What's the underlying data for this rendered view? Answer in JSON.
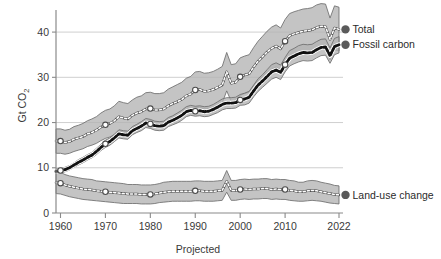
{
  "chart_data": {
    "type": "line",
    "title": "",
    "subtitle": "",
    "xlabel": "Projected",
    "ylabel": "Gt CO2",
    "ylabel_display": "Gt CO",
    "ylabel_sub": "2",
    "xlim": [
      1959,
      2022
    ],
    "ylim": [
      0,
      44
    ],
    "grid": "horizontal",
    "x_ticks": [
      1960,
      1970,
      1980,
      1990,
      2000,
      2010,
      2022
    ],
    "x_tick_labels": [
      "1960",
      "1970",
      "1980",
      "1990",
      "2000",
      "2010",
      "2022"
    ],
    "y_ticks": [
      0,
      10,
      20,
      30,
      40
    ],
    "y_tick_labels": [
      "0",
      "10",
      "20",
      "30",
      "40"
    ],
    "legend_position": "right",
    "marker_years": [
      1960,
      1970,
      1980,
      1990,
      2000,
      2010
    ],
    "end_point_year": 2022,
    "series": [
      {
        "name": "Total",
        "style": "white-dotted",
        "band": "uncertainty",
        "end_value": 40.6,
        "x": [
          1959,
          1960,
          1961,
          1962,
          1963,
          1964,
          1965,
          1966,
          1967,
          1968,
          1969,
          1970,
          1971,
          1972,
          1973,
          1974,
          1975,
          1976,
          1977,
          1978,
          1979,
          1980,
          1981,
          1982,
          1983,
          1984,
          1985,
          1986,
          1987,
          1988,
          1989,
          1990,
          1991,
          1992,
          1993,
          1994,
          1995,
          1996,
          1997,
          1998,
          1999,
          2000,
          2001,
          2002,
          2003,
          2004,
          2005,
          2006,
          2007,
          2008,
          2009,
          2010,
          2011,
          2012,
          2013,
          2014,
          2015,
          2016,
          2017,
          2018,
          2019,
          2020,
          2021,
          2022
        ],
        "values": [
          15.9,
          15.9,
          15.6,
          15.8,
          16.3,
          16.6,
          16.9,
          17.5,
          17.8,
          18.3,
          19.0,
          19.5,
          19.8,
          20.4,
          21.3,
          21.0,
          20.8,
          21.6,
          22.1,
          22.4,
          23.0,
          23.1,
          22.8,
          22.8,
          23.0,
          23.7,
          24.2,
          24.6,
          25.1,
          25.9,
          26.3,
          27.2,
          27.3,
          26.9,
          27.0,
          27.3,
          27.8,
          28.3,
          31.2,
          28.7,
          28.9,
          30.1,
          30.5,
          30.8,
          32.3,
          33.6,
          34.6,
          35.6,
          36.4,
          36.9,
          36.3,
          38.0,
          39.2,
          39.6,
          39.9,
          40.2,
          40.3,
          40.5,
          41.0,
          41.3,
          41.2,
          38.4,
          40.9,
          40.6
        ],
        "band_lower": [
          13.2,
          13.2,
          13.0,
          13.2,
          13.6,
          13.9,
          14.2,
          14.7,
          15.0,
          15.4,
          16.0,
          16.5,
          16.8,
          17.3,
          18.1,
          17.9,
          17.7,
          18.4,
          18.8,
          19.1,
          19.6,
          19.7,
          19.4,
          19.4,
          19.6,
          20.2,
          20.6,
          21.0,
          21.4,
          22.1,
          22.5,
          23.3,
          23.4,
          23.0,
          23.1,
          23.4,
          23.8,
          24.3,
          27.0,
          24.7,
          24.9,
          26.0,
          26.4,
          26.7,
          28.1,
          29.3,
          30.2,
          31.1,
          31.8,
          32.3,
          31.7,
          33.3,
          34.4,
          34.8,
          35.1,
          35.4,
          35.5,
          35.7,
          36.2,
          36.5,
          36.4,
          33.8,
          36.1,
          35.8
        ],
        "band_upper": [
          18.6,
          18.6,
          18.3,
          18.5,
          19.1,
          19.4,
          19.8,
          20.4,
          20.8,
          21.3,
          22.1,
          22.7,
          23.0,
          23.7,
          24.7,
          24.4,
          24.2,
          25.0,
          25.6,
          25.9,
          26.6,
          26.7,
          26.4,
          26.4,
          26.6,
          27.4,
          27.9,
          28.4,
          28.9,
          29.8,
          30.2,
          31.2,
          31.3,
          30.9,
          31.0,
          31.3,
          31.8,
          32.4,
          35.5,
          32.8,
          33.0,
          34.3,
          34.7,
          35.0,
          36.6,
          38.0,
          39.1,
          40.2,
          41.1,
          41.6,
          40.9,
          42.8,
          44.1,
          44.5,
          44.8,
          45.1,
          45.2,
          45.4,
          46.0,
          46.3,
          46.2,
          43.1,
          45.8,
          45.5
        ]
      },
      {
        "name": "Fossil carbon",
        "style": "black-dotted",
        "band": "uncertainty",
        "end_value": 37.2,
        "x": [
          1959,
          1960,
          1961,
          1962,
          1963,
          1964,
          1965,
          1966,
          1967,
          1968,
          1969,
          1970,
          1971,
          1972,
          1973,
          1974,
          1975,
          1976,
          1977,
          1978,
          1979,
          1980,
          1981,
          1982,
          1983,
          1984,
          1985,
          1986,
          1987,
          1988,
          1989,
          1990,
          1991,
          1992,
          1993,
          1994,
          1995,
          1996,
          1997,
          1998,
          1999,
          2000,
          2001,
          2002,
          2003,
          2004,
          2005,
          2006,
          2007,
          2008,
          2009,
          2010,
          2011,
          2012,
          2013,
          2014,
          2015,
          2016,
          2017,
          2018,
          2019,
          2020,
          2021,
          2022
        ],
        "values": [
          9.2,
          9.4,
          9.6,
          10.0,
          10.6,
          11.2,
          11.7,
          12.3,
          12.8,
          13.6,
          14.5,
          15.3,
          15.8,
          16.6,
          17.5,
          17.3,
          17.2,
          18.2,
          18.7,
          19.2,
          19.9,
          19.7,
          19.3,
          19.2,
          19.3,
          20.1,
          20.5,
          21.0,
          21.6,
          22.4,
          22.7,
          22.5,
          22.6,
          22.4,
          22.5,
          22.9,
          23.4,
          24.0,
          24.3,
          24.3,
          24.4,
          25.0,
          25.2,
          25.6,
          27.0,
          28.3,
          29.2,
          30.2,
          31.2,
          31.6,
          31.1,
          32.8,
          34.2,
          34.7,
          35.2,
          35.5,
          35.4,
          35.5,
          36.1,
          36.6,
          36.7,
          34.8,
          36.8,
          37.2
        ],
        "band_lower": [
          8.7,
          8.9,
          9.1,
          9.5,
          10.1,
          10.6,
          11.1,
          11.7,
          12.2,
          12.9,
          13.8,
          14.5,
          15.0,
          15.8,
          16.6,
          16.4,
          16.3,
          17.3,
          17.8,
          18.2,
          18.9,
          18.7,
          18.3,
          18.2,
          18.3,
          19.1,
          19.5,
          19.9,
          20.5,
          21.3,
          21.6,
          21.4,
          21.5,
          21.3,
          21.4,
          21.8,
          22.2,
          22.8,
          23.1,
          23.1,
          23.2,
          23.8,
          23.9,
          24.3,
          25.7,
          26.9,
          27.8,
          28.7,
          29.6,
          30.0,
          29.5,
          31.2,
          32.5,
          33.0,
          33.4,
          33.7,
          33.6,
          33.7,
          34.3,
          34.8,
          34.9,
          33.1,
          35.0,
          35.4
        ],
        "band_upper": [
          9.7,
          9.9,
          10.1,
          10.5,
          11.1,
          11.8,
          12.3,
          12.9,
          13.4,
          14.3,
          15.2,
          16.1,
          16.6,
          17.4,
          18.4,
          18.2,
          18.1,
          19.1,
          19.6,
          20.2,
          20.9,
          20.7,
          20.3,
          20.2,
          20.3,
          21.1,
          21.5,
          22.1,
          22.7,
          23.5,
          23.8,
          23.6,
          23.7,
          23.5,
          23.6,
          24.0,
          24.6,
          25.2,
          25.5,
          25.5,
          25.6,
          26.2,
          26.5,
          26.9,
          28.3,
          29.7,
          30.6,
          31.7,
          32.8,
          33.2,
          32.7,
          34.4,
          35.9,
          36.4,
          37.0,
          37.3,
          37.2,
          37.3,
          37.9,
          38.4,
          38.5,
          36.5,
          38.6,
          39.0
        ]
      },
      {
        "name": "Land-use change",
        "style": "white-dotted",
        "band": "uncertainty",
        "end_value": 4.0,
        "x": [
          1959,
          1960,
          1961,
          1962,
          1963,
          1964,
          1965,
          1966,
          1967,
          1968,
          1969,
          1970,
          1971,
          1972,
          1973,
          1974,
          1975,
          1976,
          1977,
          1978,
          1979,
          1980,
          1981,
          1982,
          1983,
          1984,
          1985,
          1986,
          1987,
          1988,
          1989,
          1990,
          1991,
          1992,
          1993,
          1994,
          1995,
          1996,
          1997,
          1998,
          1999,
          2000,
          2001,
          2002,
          2003,
          2004,
          2005,
          2006,
          2007,
          2008,
          2009,
          2010,
          2011,
          2012,
          2013,
          2014,
          2015,
          2016,
          2017,
          2018,
          2019,
          2020,
          2021,
          2022
        ],
        "values": [
          6.7,
          6.6,
          6.2,
          5.9,
          5.7,
          5.5,
          5.3,
          5.2,
          5.1,
          4.9,
          4.8,
          4.7,
          4.6,
          4.5,
          4.4,
          4.3,
          4.2,
          4.2,
          4.2,
          4.1,
          4.1,
          4.1,
          4.2,
          4.4,
          4.6,
          4.7,
          4.8,
          4.8,
          4.8,
          4.8,
          4.8,
          4.9,
          4.9,
          4.8,
          4.8,
          4.8,
          4.9,
          5.0,
          7.0,
          5.0,
          5.0,
          5.2,
          5.3,
          5.2,
          5.3,
          5.3,
          5.4,
          5.4,
          5.2,
          5.3,
          5.2,
          5.2,
          5.0,
          4.9,
          4.7,
          4.7,
          4.9,
          5.0,
          4.9,
          4.7,
          4.5,
          4.3,
          4.1,
          4.0
        ],
        "band_lower": [
          4.3,
          4.2,
          3.9,
          3.6,
          3.4,
          3.2,
          3.0,
          2.9,
          2.8,
          2.7,
          2.6,
          2.5,
          2.4,
          2.3,
          2.2,
          2.1,
          2.1,
          2.1,
          2.1,
          2.0,
          2.0,
          2.0,
          2.1,
          2.3,
          2.4,
          2.5,
          2.6,
          2.6,
          2.6,
          2.6,
          2.6,
          2.7,
          2.7,
          2.6,
          2.6,
          2.6,
          2.7,
          2.8,
          4.6,
          2.8,
          2.8,
          3.0,
          3.1,
          3.0,
          3.1,
          3.1,
          3.2,
          3.2,
          3.0,
          3.1,
          3.0,
          3.0,
          2.8,
          2.7,
          2.6,
          2.6,
          2.7,
          2.8,
          2.7,
          2.6,
          2.4,
          2.2,
          2.1,
          2.0
        ],
        "band_upper": [
          9.1,
          9.0,
          8.5,
          8.2,
          8.0,
          7.8,
          7.6,
          7.5,
          7.4,
          7.1,
          7.0,
          6.9,
          6.8,
          6.7,
          6.6,
          6.5,
          6.3,
          6.3,
          6.3,
          6.2,
          6.2,
          6.2,
          6.3,
          6.5,
          6.8,
          6.9,
          7.0,
          7.0,
          7.0,
          7.0,
          7.0,
          7.1,
          7.1,
          7.0,
          7.0,
          7.0,
          7.1,
          7.2,
          9.4,
          7.2,
          7.2,
          7.4,
          7.5,
          7.4,
          7.5,
          7.5,
          7.6,
          7.6,
          7.4,
          7.5,
          7.4,
          7.4,
          7.2,
          7.1,
          6.8,
          6.8,
          7.1,
          7.2,
          7.1,
          6.8,
          6.6,
          6.4,
          6.1,
          6.0
        ]
      }
    ]
  },
  "legend": {
    "items": [
      {
        "label": "Total",
        "color": "#5a5a5a"
      },
      {
        "label": "Fossil carbon",
        "color": "#5a5a5a"
      },
      {
        "label": "Land-use change",
        "color": "#5a5a5a"
      }
    ]
  },
  "colors": {
    "band_fill": "#b3b3b3",
    "band_stroke": "#6e6e6e",
    "grid": "#c9c9c9",
    "axis": "#8a8a8a",
    "dot_marker": "#5a5a5a",
    "text": "#333333",
    "background": "#ffffff"
  }
}
